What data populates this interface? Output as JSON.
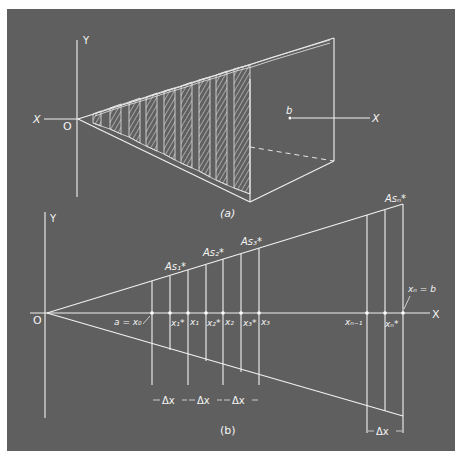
{
  "figure": {
    "background": "#5f5f5f",
    "line_color": "#f2f2f2",
    "panel_a": {
      "caption": "(a)",
      "axis_y_label": "Y",
      "axis_x_label_left": "X",
      "axis_x_label_right": "X",
      "origin_label": "O",
      "end_label": "b",
      "num_hatched_slabs": 9
    },
    "panel_b": {
      "caption": "(b)",
      "axis_y_label": "Y",
      "axis_x_label": "X",
      "origin_label": "O",
      "area_labels": [
        "As₁*",
        "As₂*",
        "As₃*",
        "Asₙ*"
      ],
      "point_labels": {
        "a_eq_x0": "a = x₀",
        "x1_star": "x₁*",
        "x1": "x₁",
        "x2_star": "x₂*",
        "x2": "x₂",
        "x3_star": "x₃*",
        "x3": "x₃",
        "xn_minus_1": "xₙ₋₁",
        "xn_star": "xₙ*",
        "xn_eq_b": "xₙ = b"
      },
      "delta_label": "Δx",
      "delta_count_left": 3,
      "delta_count_right": 1
    }
  }
}
